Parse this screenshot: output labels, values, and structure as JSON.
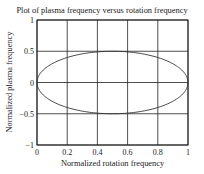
{
  "chart_data": {
    "type": "line",
    "title": "Plot of plasma frequency versus rotation frequency",
    "xlabel": "Normalized rotation frequency",
    "ylabel": "Normalized plasma frequency",
    "xlim": [
      0,
      1
    ],
    "ylim": [
      -1,
      1
    ],
    "grid": true,
    "legend": null,
    "xticks": [
      "0",
      "0.2",
      "0.4",
      "0.6",
      "0.8",
      "1"
    ],
    "yticks": [
      "1",
      "0.5",
      "0",
      "−0.5",
      "−1"
    ],
    "series": [
      {
        "name": "upper branch",
        "x": [
          0,
          0.05,
          0.1,
          0.2,
          0.3,
          0.4,
          0.5,
          0.6,
          0.7,
          0.8,
          0.9,
          0.95,
          1
        ],
        "y": [
          0,
          0.218,
          0.3,
          0.4,
          0.458,
          0.49,
          0.5,
          0.49,
          0.458,
          0.4,
          0.3,
          0.218,
          0
        ]
      },
      {
        "name": "lower branch",
        "x": [
          0,
          0.05,
          0.1,
          0.2,
          0.3,
          0.4,
          0.5,
          0.6,
          0.7,
          0.8,
          0.9,
          0.95,
          1
        ],
        "y": [
          0,
          -0.218,
          -0.3,
          -0.4,
          -0.458,
          -0.49,
          -0.5,
          -0.49,
          -0.458,
          -0.4,
          -0.3,
          -0.218,
          0
        ]
      }
    ],
    "colors": {
      "line": "#333333",
      "grid": "#222222",
      "frame": "#222222"
    }
  }
}
